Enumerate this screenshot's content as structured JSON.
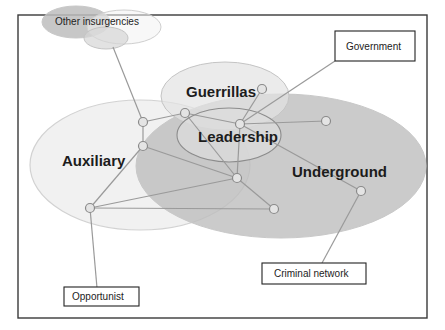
{
  "diagram": {
    "groups": {
      "other_insurgencies": "Other insurgencies",
      "guerrillas": "Guerrillas",
      "leadership": "Leadership",
      "auxiliary": "Auxiliary",
      "underground": "Underground"
    },
    "external_actors": {
      "government": "Government",
      "criminal_network": "Criminal network",
      "opportunist": "Opportunist"
    },
    "colors": {
      "underground_fill": "#c8c8c8",
      "auxiliary_fill": "#ececec",
      "guerrillas_fill": "#dedede",
      "leadership_fill": "#dcdcdc",
      "edge": "#9a9a9a",
      "node_fill": "#e4e4e4",
      "frame": "#3a3a3a"
    },
    "nodes": [
      {
        "id": "n1",
        "group": "auxiliary"
      },
      {
        "id": "n2",
        "group": "auxiliary"
      },
      {
        "id": "n3",
        "group": "guerrillas"
      },
      {
        "id": "n4",
        "group": "leadership"
      },
      {
        "id": "n5",
        "group": "guerrillas"
      },
      {
        "id": "n6",
        "group": "underground"
      },
      {
        "id": "n7",
        "group": "underground"
      },
      {
        "id": "n8",
        "group": "underground"
      },
      {
        "id": "n9",
        "group": "auxiliary"
      },
      {
        "id": "n10",
        "group": "underground"
      }
    ]
  }
}
